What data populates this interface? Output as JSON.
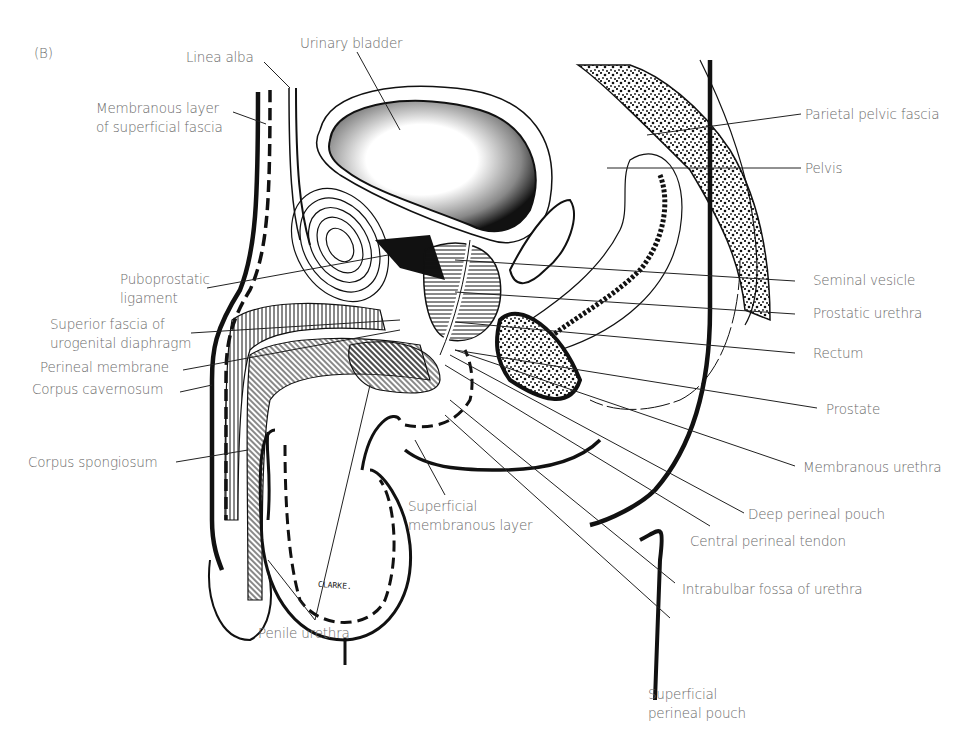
{
  "figure": {
    "panel_label": "(B)",
    "artist_signature": "CLARKE.",
    "labels": {
      "linea_alba": "Linea alba",
      "urinary_bladder": "Urinary bladder",
      "membranous_layer_superficial_fascia": "Membranous layer\nof superficial fascia",
      "parietal_pelvic_fascia": "Parietal pelvic fascia",
      "pelvis": "Pelvis",
      "puboprostatic_ligament": "Puboprostatic\nligament",
      "seminal_vesicle": "Seminal vesicle",
      "prostatic_urethra": "Prostatic urethra",
      "superior_fascia_urogenital_diaphragm": "Superior fascia of\nurogenital diaphragm",
      "rectum": "Rectum",
      "perineal_membrane": "Perineal membrane",
      "corpus_cavernosum": "Corpus cavernosum",
      "prostate": "Prostate",
      "membranous_urethra": "Membranous urethra",
      "corpus_spongiosum": "Corpus spongiosum",
      "deep_perineal_pouch": "Deep perineal pouch",
      "superficial_membranous_layer": "Superficial\nmembranous layer",
      "central_perineal_tendon": "Central perineal tendon",
      "intrabulbar_fossa_urethra": "Intrabulbar fossa of urethra",
      "penile_urethra": "Penile urethra",
      "superficial_perineal_pouch": "Superficial\nperineal pouch"
    }
  }
}
